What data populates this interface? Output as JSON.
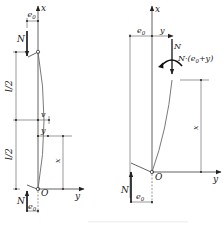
{
  "figure": {
    "left_diagram": {
      "axis_x_label": "x",
      "axis_y_label": "y",
      "origin_label": "O",
      "top_force_label": "N",
      "top_eccentricity_label": "e",
      "top_eccentricity_sub": "0",
      "half_length_upper_label": "l/2",
      "half_length_lower_label": "l/2",
      "max_deflection_label": "v",
      "deflection_label": "y",
      "height_label": "x",
      "bottom_force_label": "N",
      "bottom_eccentricity_label": "e",
      "bottom_eccentricity_sub": "0"
    },
    "right_diagram": {
      "axis_x_label": "x",
      "axis_y_label": "y",
      "origin_label": "O",
      "eccentricity_label": "e",
      "eccentricity_sub": "0",
      "deflection_label": "y",
      "force_label": "N",
      "moment_label_prefix": "N·(e",
      "moment_label_sub": "0",
      "moment_label_suffix": "+y)",
      "height_label": "x",
      "bottom_force_label": "N",
      "bottom_eccentricity_label": "e",
      "bottom_eccentricity_sub": "0"
    },
    "colors": {
      "line": "#3a3a3a",
      "curve": "#6a6a6a",
      "background": "#ffffff"
    }
  }
}
